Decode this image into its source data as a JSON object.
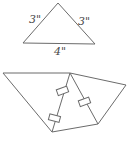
{
  "triangle": {
    "side_left_label": "3\"",
    "side_right_label": "3\"",
    "base_label": "4\"",
    "stroke_color": "#6b6b6b"
  },
  "folded_shape": {
    "hinge_count": 3,
    "stroke_color": "#6b6b6b"
  }
}
